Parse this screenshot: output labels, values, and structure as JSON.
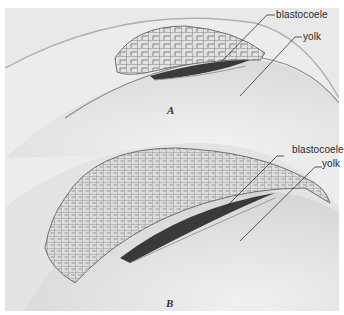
{
  "figure": {
    "panels": [
      {
        "id": "A",
        "letter": "A",
        "labels": [
          {
            "text": "blastocoele"
          },
          {
            "text": "yolk"
          }
        ]
      },
      {
        "id": "B",
        "letter": "B",
        "labels": [
          {
            "text": "blastocoele"
          },
          {
            "text": "yolk"
          }
        ]
      }
    ],
    "colors": {
      "background": "#ececec",
      "yolk_surface": "#e6e6e6",
      "cell_outline": "#555555",
      "leader_line": "#333333"
    }
  }
}
